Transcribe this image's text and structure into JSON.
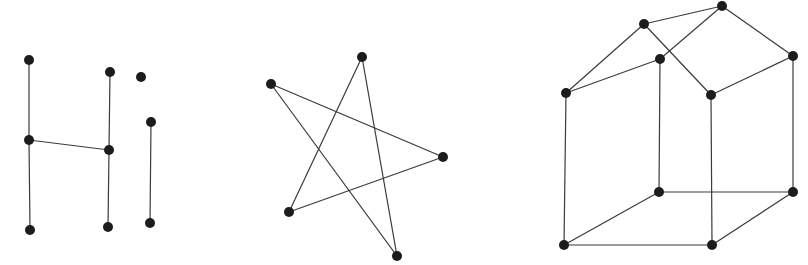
{
  "diagram": {
    "width": 808,
    "height": 265,
    "node_radius": 5,
    "node_color": "#1c1c1c",
    "edge_color": "#3a3a3a",
    "graphs": [
      {
        "name": "hi-graph",
        "nodes": [
          {
            "id": "h1",
            "x": 29,
            "y": 60
          },
          {
            "id": "h2",
            "x": 29,
            "y": 140
          },
          {
            "id": "h3",
            "x": 30,
            "y": 230
          },
          {
            "id": "h4",
            "x": 110,
            "y": 72
          },
          {
            "id": "h5",
            "x": 109,
            "y": 150
          },
          {
            "id": "h6",
            "x": 108,
            "y": 227
          },
          {
            "id": "i1",
            "x": 141,
            "y": 77
          },
          {
            "id": "i2",
            "x": 151,
            "y": 122
          },
          {
            "id": "i3",
            "x": 150,
            "y": 223
          }
        ],
        "edges": [
          [
            "h1",
            "h2"
          ],
          [
            "h2",
            "h3"
          ],
          [
            "h2",
            "h5"
          ],
          [
            "h4",
            "h5"
          ],
          [
            "h5",
            "h6"
          ],
          [
            "i2",
            "i3"
          ]
        ]
      },
      {
        "name": "star-graph",
        "nodes": [
          {
            "id": "s1",
            "x": 362,
            "y": 57
          },
          {
            "id": "s2",
            "x": 271,
            "y": 84
          },
          {
            "id": "s3",
            "x": 443,
            "y": 157
          },
          {
            "id": "s4",
            "x": 289,
            "y": 212
          },
          {
            "id": "s5",
            "x": 397,
            "y": 256
          }
        ],
        "edges": [
          [
            "s2",
            "s3"
          ],
          [
            "s2",
            "s5"
          ],
          [
            "s1",
            "s4"
          ],
          [
            "s1",
            "s5"
          ],
          [
            "s4",
            "s3"
          ]
        ]
      },
      {
        "name": "house-graph",
        "nodes": [
          {
            "id": "a",
            "x": 644,
            "y": 24
          },
          {
            "id": "b",
            "x": 722,
            "y": 6
          },
          {
            "id": "c",
            "x": 660,
            "y": 59
          },
          {
            "id": "d",
            "x": 566,
            "y": 93
          },
          {
            "id": "e",
            "x": 711,
            "y": 95
          },
          {
            "id": "f",
            "x": 793,
            "y": 56
          },
          {
            "id": "g",
            "x": 659,
            "y": 192
          },
          {
            "id": "h",
            "x": 793,
            "y": 192
          },
          {
            "id": "i",
            "x": 564,
            "y": 245
          },
          {
            "id": "j",
            "x": 712,
            "y": 245
          }
        ],
        "edges": [
          [
            "a",
            "b"
          ],
          [
            "a",
            "d"
          ],
          [
            "a",
            "e"
          ],
          [
            "b",
            "c"
          ],
          [
            "b",
            "f"
          ],
          [
            "c",
            "d"
          ],
          [
            "c",
            "g"
          ],
          [
            "d",
            "i"
          ],
          [
            "e",
            "f"
          ],
          [
            "e",
            "j"
          ],
          [
            "f",
            "h"
          ],
          [
            "g",
            "h"
          ],
          [
            "g",
            "i"
          ],
          [
            "h",
            "j"
          ],
          [
            "i",
            "j"
          ]
        ]
      }
    ]
  }
}
